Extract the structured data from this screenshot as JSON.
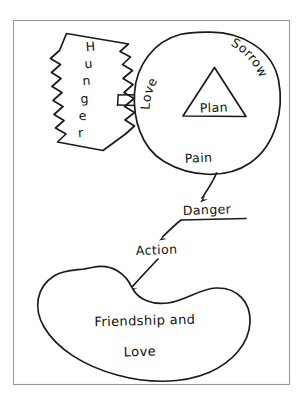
{
  "diagram": {
    "style": "hand-drawn sketch, black ink on white paper, thin gray frame",
    "frame": {
      "x": 13,
      "y": 20,
      "width": 277,
      "height": 365,
      "stroke": "#9a9a9a"
    },
    "ink_color": "#1b1b1b",
    "background": "#ffffff",
    "nodes": [
      {
        "id": "hunger",
        "label": "Hunger",
        "shape": "jagged-banner",
        "orientation": "tilted, letters stacked vertically",
        "letters": [
          "H",
          "u",
          "n",
          "g",
          "e",
          "r"
        ]
      },
      {
        "id": "circle",
        "label": "",
        "shape": "circle",
        "inner_labels": [
          "Love",
          "Sorrow",
          "Pain"
        ],
        "love": "Love",
        "sorrow": "Sorrow",
        "pain": "Pain"
      },
      {
        "id": "triangle",
        "label": "Plan",
        "shape": "triangle"
      },
      {
        "id": "danger",
        "label": "Danger",
        "shape": "underlined-text"
      },
      {
        "id": "action",
        "label": "Action",
        "shape": "text"
      },
      {
        "id": "blob",
        "label_line1": "Friendship  and",
        "label_line2": "Love",
        "shape": "bean-blob"
      }
    ],
    "connectors": [
      {
        "id": "hunger-to-circle",
        "type": "double-line",
        "from": "hunger",
        "to": "circle"
      },
      {
        "id": "circle-to-danger",
        "type": "arrow",
        "from": "circle",
        "to": "danger"
      },
      {
        "id": "danger-to-action",
        "type": "arrow",
        "from": "danger",
        "to": "action"
      },
      {
        "id": "action-to-blob",
        "type": "arrow",
        "from": "action",
        "to": "blob"
      }
    ]
  }
}
